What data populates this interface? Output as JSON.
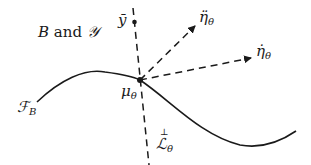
{
  "diagram": {
    "title_label": "B and 𝒴",
    "title_parts": {
      "a": "B",
      "b": " and ",
      "c": "𝒴"
    },
    "labels": {
      "y_bar": "ȳ",
      "eta_ddot": "η̈",
      "eta_ddot_sub": "θ",
      "eta_dot": "η̇",
      "eta_dot_sub": "θ",
      "mu": "μ",
      "mu_sub": "θ",
      "F": "ℱ",
      "F_sub": "B",
      "L_perp_top": "⊥",
      "L": "ℒ",
      "L_sub": "θ"
    },
    "colors": {
      "stroke": "#1a1a1a",
      "background": "#ffffff"
    }
  }
}
